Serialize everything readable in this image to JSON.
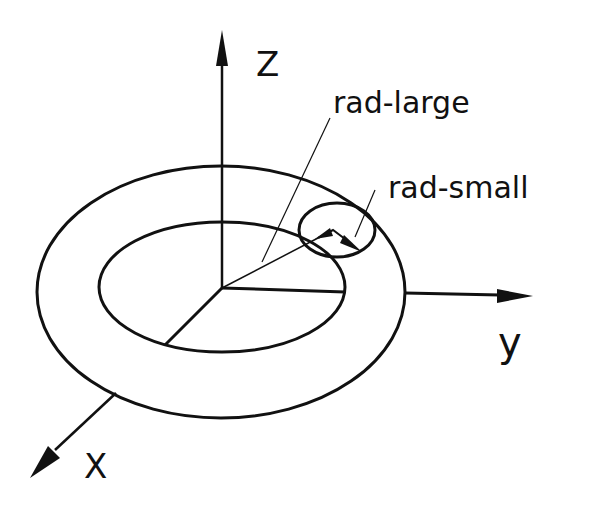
{
  "diagram": {
    "type": "torus-coordinate-sketch",
    "colors": {
      "stroke": "#111111",
      "background": "#ffffff"
    },
    "axes": {
      "z": {
        "label": "Z"
      },
      "y": {
        "label": "y"
      },
      "x": {
        "label": "X"
      }
    },
    "annotations": {
      "rad_large": {
        "label": "rad-large"
      },
      "rad_small": {
        "label": "rad-small"
      }
    },
    "shapes": {
      "outer_ellipse": "torus outer edge",
      "inner_ellipse": "torus inner edge (hole)",
      "tube_cross_section": "small circle showing tube radius"
    }
  }
}
